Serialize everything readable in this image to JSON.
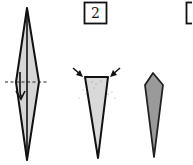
{
  "diagram": {
    "type": "origami-instructions",
    "steps": [
      {
        "number": "",
        "description": "Thin diamond base with center crease; fold along dashed line (valley fold) in the direction of the arrow",
        "fill_color": "#d6d6d6",
        "elements": [
          "diamond-shape",
          "center-crease",
          "dashed-fold-line",
          "fold-arrow"
        ]
      },
      {
        "number": "2",
        "description": "Narrow triangle with flat top; push in both top corners (sink/squash arrows)",
        "fill_color": "#d9d9d9",
        "elements": [
          "triangle-shape",
          "push-arrow-left",
          "push-arrow-right"
        ]
      },
      {
        "number": "3",
        "description": "Finished pointed kite shape (result)",
        "fill_color": "#9a9a9a",
        "elements": [
          "kite-shape"
        ]
      }
    ],
    "colors": {
      "outline": "#111111",
      "light_fill": "#d6d6d6",
      "dark_fill": "#9a9a9a",
      "background": "#ffffff"
    }
  }
}
